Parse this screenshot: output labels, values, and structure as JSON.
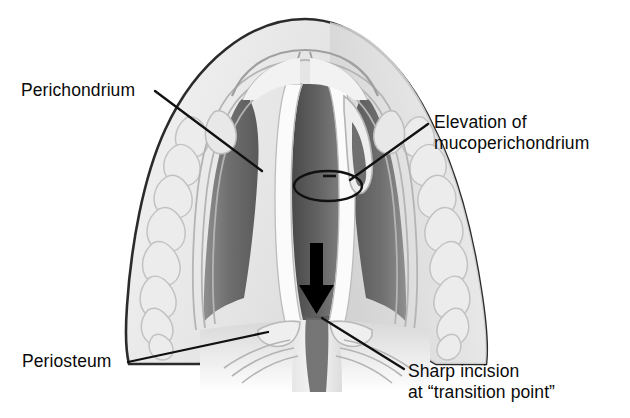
{
  "figure": {
    "background_color": "#ffffff",
    "view": "coronal cross-section through nasal tip and septum",
    "annotations": [
      {
        "id": "perichondrium",
        "label": "Perichondrium",
        "line1": "Perichondrium",
        "line2": "",
        "side": "left",
        "leader": "diagonal line from label to upper-left lateral cartilage lining"
      },
      {
        "id": "elevation",
        "label": "Elevation of mucoperichondrium",
        "line1": "Elevation of",
        "line2": "mucoperichondrium",
        "side": "right",
        "leader": "diagonal line from label down-left to ellipse marker on septum"
      },
      {
        "id": "periosteum",
        "label": "Periosteum",
        "line1": "Periosteum",
        "line2": "",
        "side": "left",
        "leader": "long shallow diagonal line from label to base of septum"
      },
      {
        "id": "sharp-incision",
        "label": "Sharp incision at \"transition point\"",
        "line1": "Sharp incision",
        "line2": "at “transition point”",
        "side": "right",
        "leader": "diagonal line from label up-left to the transition point at septum base"
      }
    ],
    "markers": [
      {
        "id": "elevation-ellipse",
        "name": "ellipse-marker",
        "shape": "open ellipse with short horizontal dash inside",
        "meaning": "region of mucoperichondrial elevation"
      },
      {
        "id": "incision-arrow",
        "name": "down-arrow",
        "shape": "solid black downward arrow",
        "meaning": "direction of sharp incision at transition point",
        "color": "#000000"
      }
    ],
    "palette": {
      "outline": "#2a2a2a",
      "soft_tissue_light": "#e9e9e9",
      "soft_tissue_mid": "#cfcfcf",
      "airway_dark": "#6d6d6d",
      "airway_darker": "#4f4f4f",
      "cartilage_white": "#fbfbfb",
      "mucosa_gray": "#b0b0b0",
      "lobule_outline": "#bdbdbd",
      "leader_line": "#111111",
      "text": "#0a0a0a"
    }
  }
}
